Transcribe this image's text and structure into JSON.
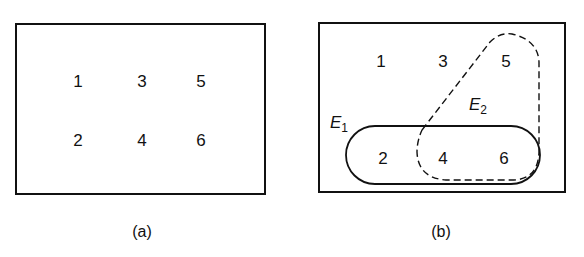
{
  "panel_a": {
    "caption": "(a)",
    "elements": [
      "1",
      "3",
      "5",
      "2",
      "4",
      "6"
    ]
  },
  "panel_b": {
    "caption": "(b)",
    "elements": [
      "1",
      "3",
      "5",
      "2",
      "4",
      "6"
    ],
    "events": {
      "e1": {
        "letter": "E",
        "subscript": "1",
        "members": [
          "2",
          "4",
          "6"
        ],
        "line": "solid"
      },
      "e2": {
        "letter": "E",
        "subscript": "2",
        "members": [
          "4",
          "5",
          "6"
        ],
        "line": "dashed"
      }
    }
  },
  "colors": {
    "stroke": "#111111",
    "background": "#ffffff"
  }
}
